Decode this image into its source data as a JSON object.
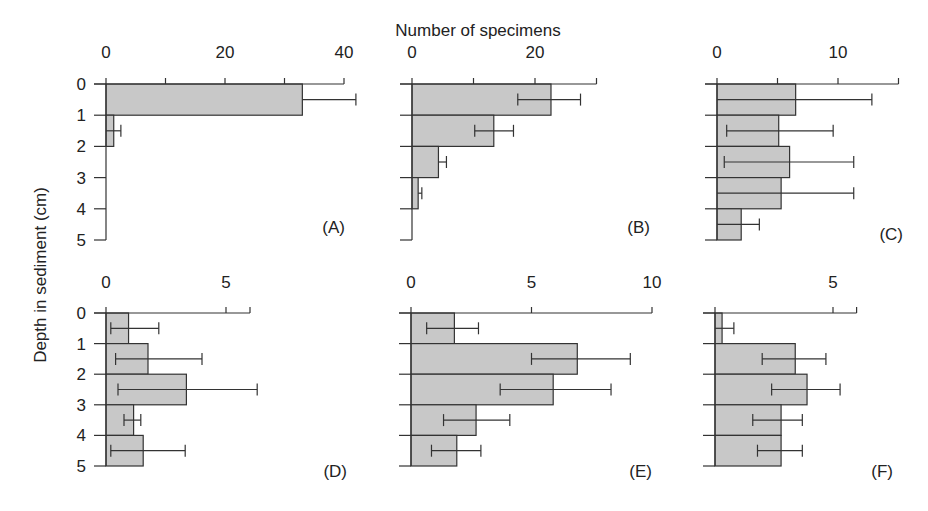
{
  "chart_data": {
    "type": "bar",
    "orientation": "horizontal",
    "title": "",
    "xlabel": "Number of specimens",
    "ylabel": "Depth in sediment (cm)",
    "depth_ticks": [
      "0",
      "1",
      "2",
      "3",
      "4",
      "5"
    ],
    "depth_intervals": [
      "0-1",
      "1-2",
      "2-3",
      "3-4",
      "4-5"
    ],
    "panels": [
      {
        "label": "(A)",
        "xlim": [
          0,
          40
        ],
        "x_ticks": [
          0,
          10,
          20,
          30,
          40
        ],
        "x_tick_labels": [
          "0",
          "20",
          "40"
        ],
        "values": [
          33,
          1.3,
          0,
          0,
          0
        ],
        "err_low": [
          33,
          0,
          null,
          null,
          null
        ],
        "err_high": [
          42,
          2.5,
          null,
          null,
          null
        ]
      },
      {
        "label": "(B)",
        "xlim": [
          0,
          30
        ],
        "x_ticks": [
          0,
          10,
          20,
          30
        ],
        "x_tick_labels": [
          "0",
          "20"
        ],
        "values": [
          22.6,
          13.3,
          4.3,
          1.0,
          0
        ],
        "err_low": [
          17.2,
          10.2,
          4.3,
          1.0,
          null
        ],
        "err_high": [
          27.4,
          16.5,
          5.6,
          1.6,
          null
        ]
      },
      {
        "label": "(C)",
        "xlim": [
          0,
          15
        ],
        "x_ticks": [
          0,
          5,
          10,
          15
        ],
        "x_tick_labels": [
          "0",
          "10"
        ],
        "values": [
          6.5,
          5.1,
          6.0,
          5.3,
          2.0
        ],
        "err_low": [
          0,
          0.8,
          0.6,
          0,
          0
        ],
        "err_high": [
          12.8,
          9.6,
          11.3,
          11.3,
          3.5
        ]
      },
      {
        "label": "(D)",
        "xlim": [
          0,
          6
        ],
        "x_ticks": [
          0,
          5,
          6
        ],
        "x_tick_labels": [
          "0",
          "5"
        ],
        "values": [
          0.94,
          1.75,
          3.35,
          1.15,
          1.55
        ],
        "err_low": [
          0.2,
          0.4,
          0.5,
          0.75,
          0.2
        ],
        "err_high": [
          2.2,
          4.0,
          6.3,
          1.45,
          3.3
        ]
      },
      {
        "label": "(E)",
        "xlim": [
          0,
          10
        ],
        "x_ticks": [
          0,
          5,
          10
        ],
        "x_tick_labels": [
          "0",
          "5",
          "10"
        ],
        "values": [
          1.8,
          6.9,
          5.9,
          2.7,
          1.9
        ],
        "err_low": [
          0.65,
          5.0,
          3.7,
          1.35,
          0.85
        ],
        "err_high": [
          2.8,
          9.1,
          8.3,
          4.1,
          2.9
        ]
      },
      {
        "label": "(F)",
        "xlim": [
          0,
          6
        ],
        "x_ticks": [
          0,
          5,
          6
        ],
        "x_tick_labels": [
          "",
          "5"
        ],
        "values": [
          0.3,
          3.4,
          3.9,
          2.8,
          2.8
        ],
        "err_low": [
          0,
          2.0,
          2.4,
          1.6,
          1.8
        ],
        "err_high": [
          0.8,
          4.7,
          5.3,
          3.7,
          3.7
        ]
      }
    ],
    "grid": false,
    "legend": null
  },
  "layout": {
    "panels": [
      {
        "x0": 106,
        "px_per_unit": 5.95,
        "y_top": 84,
        "y_bottom": 240,
        "label_x": 345,
        "label_y": 233,
        "tick_label_y": 66,
        "show_depth_labels": true
      },
      {
        "x0": 412,
        "px_per_unit": 6.15,
        "y_top": 84,
        "y_bottom": 240,
        "label_x": 650,
        "label_y": 233,
        "tick_label_y": 66,
        "show_depth_labels": false
      },
      {
        "x0": 717,
        "px_per_unit": 12.1,
        "y_top": 84,
        "y_bottom": 240,
        "label_x": 903,
        "label_y": 240,
        "tick_label_y": 66,
        "show_depth_labels": false
      },
      {
        "x0": 106,
        "px_per_unit": 24.0,
        "y_top": 313,
        "y_bottom": 466,
        "label_x": 347,
        "label_y": 477,
        "tick_label_y": 296,
        "show_depth_labels": true
      },
      {
        "x0": 411,
        "px_per_unit": 24.1,
        "y_top": 313,
        "y_bottom": 466,
        "label_x": 652,
        "label_y": 477,
        "tick_label_y": 296,
        "show_depth_labels": false
      },
      {
        "x0": 715,
        "px_per_unit": 23.6,
        "y_top": 313,
        "y_bottom": 466,
        "label_x": 893,
        "label_y": 477,
        "tick_label_y": 296,
        "show_depth_labels": false
      }
    ],
    "xlabel_pos": [
      478,
      36
    ],
    "ylabel_pos": [
      46,
      275
    ]
  }
}
